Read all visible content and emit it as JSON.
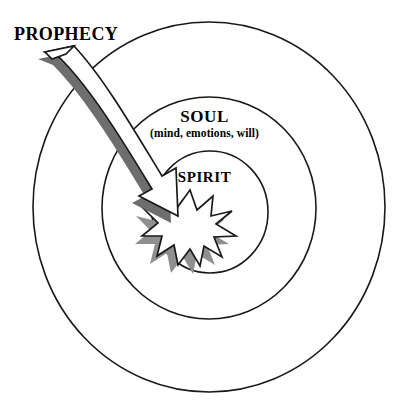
{
  "diagram": {
    "background_color": "#ffffff",
    "stroke_color": "#1a1a1a",
    "shadow_color": "#808080",
    "fill_color": "#ffffff"
  },
  "labels": {
    "prophecy": "PROPHECY",
    "soul": "SOUL",
    "soul_sub": "(mind, emotions, will)",
    "spirit": "SPIRIT"
  },
  "rings": [
    {
      "name": "outer-ring",
      "label": "",
      "cx": 209,
      "cy": 207,
      "rx": 176,
      "ry": 185
    },
    {
      "name": "soul-ring",
      "label": "SOUL",
      "cx": 209,
      "cy": 208,
      "rx": 107,
      "ry": 111
    },
    {
      "name": "spirit-ring",
      "label": "SPIRIT",
      "cx": 210,
      "cy": 212,
      "rx": 58,
      "ry": 61
    }
  ],
  "starburst": {
    "name": "spirit-starburst",
    "cx": 190,
    "cy": 228,
    "points": 11,
    "outer_radius": 38,
    "inner_radius": 17,
    "fill": "#ffffff",
    "shadow_offset_x": -6,
    "shadow_offset_y": 7
  },
  "arrow": {
    "name": "prophecy-arrow",
    "from_x": 45,
    "from_y": 55,
    "to_x": 176,
    "to_y": 216,
    "fill": "#ffffff",
    "shadow_offset_x": -6,
    "shadow_offset_y": 6
  }
}
